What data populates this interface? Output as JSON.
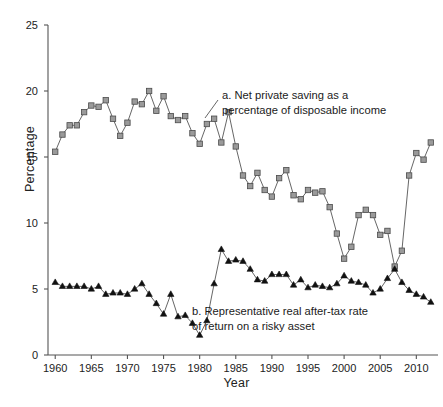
{
  "chart_data": {
    "type": "line",
    "title": "",
    "xlabel": "Year",
    "ylabel": "Percentage",
    "xlim": [
      1959,
      2013
    ],
    "ylim": [
      0,
      25
    ],
    "grid": false,
    "legend_position": "inline-annotations",
    "xticks": [
      1960,
      1965,
      1970,
      1975,
      1980,
      1985,
      1990,
      1995,
      2000,
      2005,
      2010
    ],
    "yticks": [
      0,
      5,
      10,
      15,
      20,
      25
    ],
    "x": [
      1960,
      1961,
      1962,
      1963,
      1964,
      1965,
      1966,
      1967,
      1968,
      1969,
      1970,
      1971,
      1972,
      1973,
      1974,
      1975,
      1976,
      1977,
      1978,
      1979,
      1980,
      1981,
      1982,
      1983,
      1984,
      1985,
      1986,
      1987,
      1988,
      1989,
      1990,
      1991,
      1992,
      1993,
      1994,
      1995,
      1996,
      1997,
      1998,
      1999,
      2000,
      2001,
      2002,
      2003,
      2004,
      2005,
      2006,
      2007,
      2008,
      2009,
      2010,
      2011,
      2012
    ],
    "series": [
      {
        "name": "a. Net private saving as a percentage of disposable income",
        "marker": "square",
        "color": "#9a9a9a",
        "edge_color": "#4a4a4a",
        "values": [
          15.4,
          16.7,
          17.4,
          17.4,
          18.4,
          18.9,
          18.8,
          19.3,
          17.9,
          16.6,
          17.6,
          19.2,
          19.0,
          20.0,
          18.5,
          19.6,
          18.1,
          17.8,
          18.1,
          16.8,
          16.0,
          17.5,
          17.9,
          16.1,
          18.4,
          15.8,
          13.6,
          12.8,
          13.8,
          12.5,
          12.0,
          13.4,
          14.0,
          12.1,
          11.8,
          12.5,
          12.3,
          12.4,
          11.2,
          9.2,
          7.3,
          8.2,
          10.6,
          11.0,
          10.6,
          9.1,
          9.4,
          6.7,
          7.9,
          13.6,
          15.3,
          14.8,
          16.1
        ]
      },
      {
        "name": "b. Representative real after-tax rate of return on a risky asset",
        "marker": "triangle",
        "color": "#111111",
        "edge_color": "#111111",
        "values": [
          5.5,
          5.2,
          5.2,
          5.2,
          5.2,
          5.0,
          5.2,
          4.6,
          4.7,
          4.7,
          4.6,
          5.0,
          5.4,
          4.6,
          3.9,
          3.1,
          4.6,
          2.9,
          3.0,
          2.4,
          1.5,
          2.6,
          5.4,
          8.0,
          7.1,
          7.2,
          7.1,
          6.5,
          5.7,
          5.6,
          6.1,
          6.1,
          6.1,
          5.3,
          5.7,
          5.1,
          5.3,
          5.2,
          5.1,
          5.4,
          6.0,
          5.6,
          5.5,
          5.3,
          4.7,
          5.0,
          5.8,
          6.5,
          5.5,
          4.9,
          4.6,
          4.4,
          4.0
        ]
      }
    ],
    "annotations": [
      {
        "id": "a",
        "text": "a. Net private saving as a\npercentage of disposable income"
      },
      {
        "id": "b",
        "text": "b. Representative real after-tax rate\nof return on a risky asset"
      }
    ]
  }
}
